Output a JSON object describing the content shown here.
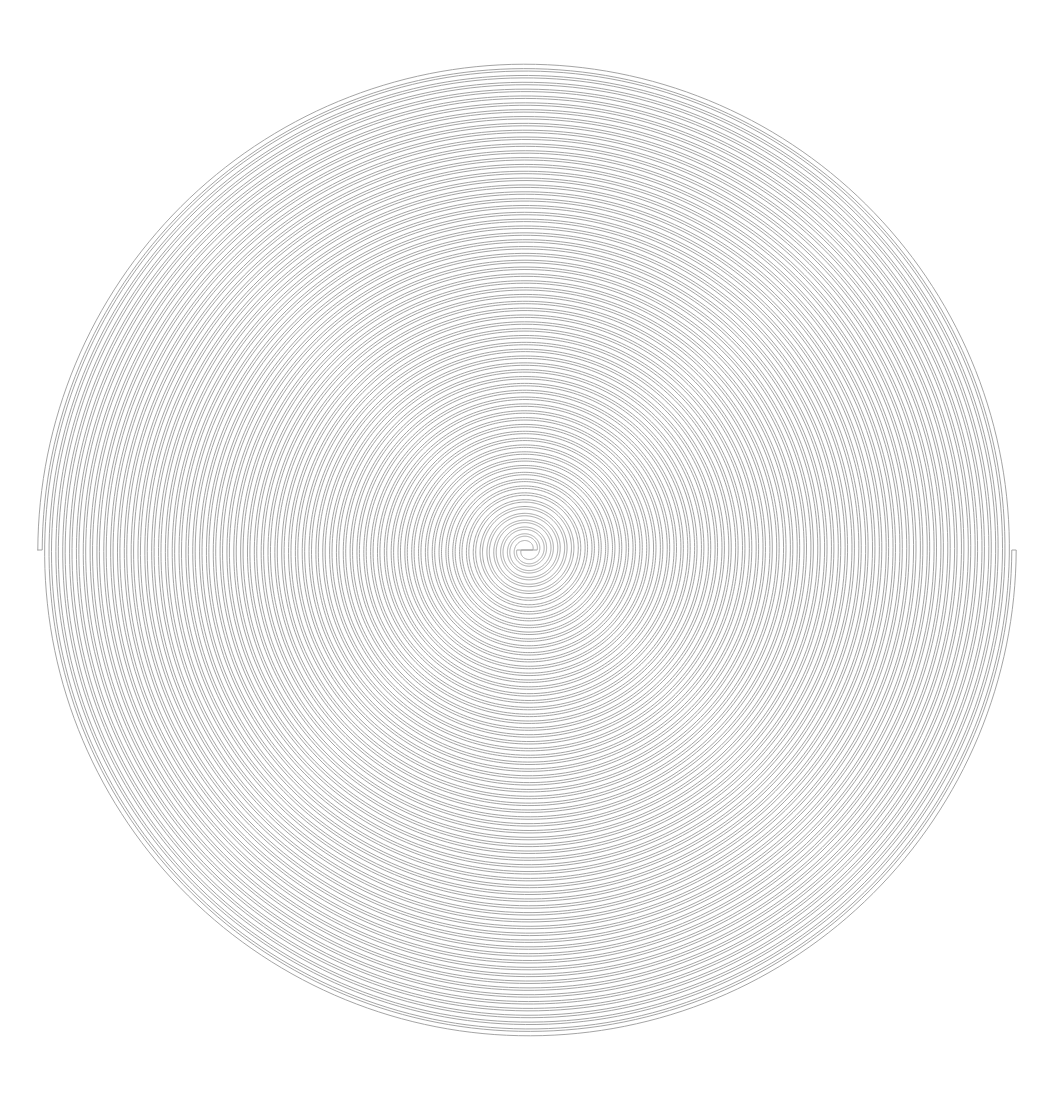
{
  "figure": {
    "kind": "double-line archimedean spiral",
    "width": 1053,
    "height": 1114,
    "background": "#ffffff",
    "stroke_color": "#9a9a9a",
    "stroke_width": 0.9,
    "center": [
      527,
      550
    ],
    "outer_radius": 487,
    "inner_radius": 8,
    "turns": 35,
    "arm_count": 2,
    "outer_end_left": [
      40,
      556
    ],
    "outer_end_right": [
      1012,
      556
    ]
  }
}
